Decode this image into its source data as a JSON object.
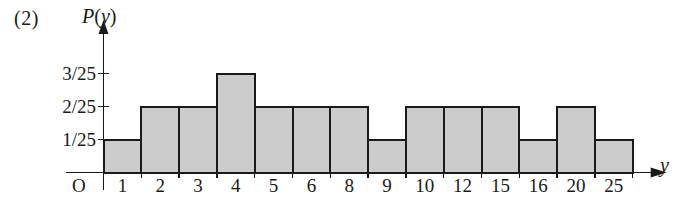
{
  "figure": {
    "problem_number": "(2)",
    "y_axis_title_main": "P",
    "y_axis_title_paren_open": "(",
    "y_axis_title_var": "y",
    "y_axis_title_paren_close": ")",
    "x_axis_title": "y",
    "origin_label": "O",
    "ink_color": "#1a1a1a",
    "bar_fill_color": "#cccccc",
    "background_color": "#ffffff"
  },
  "chart_data": {
    "type": "bar",
    "title": "P(y)",
    "subtitle": "(2)",
    "xlabel": "y",
    "ylabel": "P(y)",
    "categories": [
      "1",
      "2",
      "3",
      "4",
      "5",
      "6",
      "8",
      "9",
      "10",
      "12",
      "15",
      "16",
      "20",
      "25"
    ],
    "values": [
      1,
      2,
      2,
      3,
      2,
      2,
      2,
      1,
      2,
      2,
      2,
      1,
      2,
      1
    ],
    "value_labels": [
      "1/25",
      "2/25",
      "2/25",
      "3/25",
      "2/25",
      "2/25",
      "2/25",
      "1/25",
      "2/25",
      "2/25",
      "2/25",
      "1/25",
      "2/25",
      "1/25"
    ],
    "value_unit_denominator": 25,
    "ytick_values": [
      1,
      2,
      3
    ],
    "ytick_labels": [
      "1/25",
      "2/25",
      "3/25"
    ],
    "ylim": [
      0,
      3.6
    ],
    "grid": false,
    "legend": false,
    "axis_arrows": true,
    "bar_style": "contiguous-histogram"
  }
}
